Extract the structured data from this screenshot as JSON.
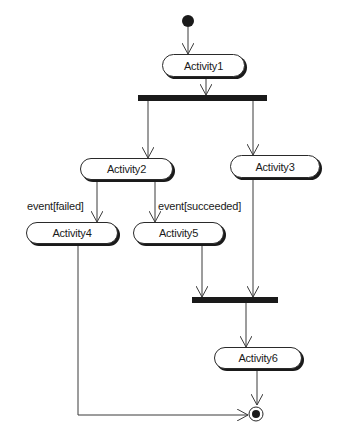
{
  "diagram": {
    "type": "uml-activity-diagram",
    "colors": {
      "line": "#3a3a3a",
      "bar": "#1a1a1a",
      "node_border": "#2a2a2a",
      "background": "#ffffff"
    },
    "initial_node": {
      "label": "initial"
    },
    "final_node": {
      "label": "final"
    },
    "activities": [
      {
        "id": "a1",
        "label": "Activity1"
      },
      {
        "id": "a2",
        "label": "Activity2"
      },
      {
        "id": "a3",
        "label": "Activity3"
      },
      {
        "id": "a4",
        "label": "Activity4"
      },
      {
        "id": "a5",
        "label": "Activity5"
      },
      {
        "id": "a6",
        "label": "Activity6"
      }
    ],
    "bars": [
      {
        "id": "fork",
        "kind": "fork"
      },
      {
        "id": "join",
        "kind": "join"
      }
    ],
    "guards": [
      {
        "label": "event[failed]"
      },
      {
        "label": "event[succeeded]"
      }
    ],
    "edges": [
      {
        "from": "initial",
        "to": "Activity1"
      },
      {
        "from": "Activity1",
        "to": "fork"
      },
      {
        "from": "fork",
        "to": "Activity2"
      },
      {
        "from": "fork",
        "to": "Activity3"
      },
      {
        "from": "Activity2",
        "to": "Activity4",
        "guard": "event[failed]"
      },
      {
        "from": "Activity2",
        "to": "Activity5",
        "guard": "event[succeeded]"
      },
      {
        "from": "Activity5",
        "to": "join"
      },
      {
        "from": "Activity3",
        "to": "join"
      },
      {
        "from": "join",
        "to": "Activity6"
      },
      {
        "from": "Activity6",
        "to": "final"
      },
      {
        "from": "Activity4",
        "to": "final"
      }
    ]
  }
}
